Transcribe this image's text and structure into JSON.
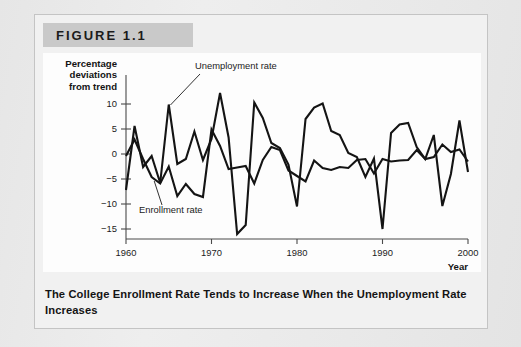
{
  "figure": {
    "banner_label": "FIGURE 1.1",
    "caption": "The College Enrollment Rate Tends to Increase When the Unemployment Rate Increases"
  },
  "chart_data": {
    "type": "line",
    "title": "",
    "xlabel": "Year",
    "ylabel": "Percentage deviations from trend",
    "ylabel_lines": [
      "Percentage",
      "deviations",
      "from trend"
    ],
    "xlim": [
      1960,
      2000
    ],
    "ylim": [
      -17,
      13
    ],
    "yticks": [
      10,
      5,
      0,
      -5,
      -10,
      -15
    ],
    "ytick_labels": [
      "10",
      "5",
      "0",
      "−5",
      "−10",
      "−15"
    ],
    "xticks": [
      1960,
      1970,
      1980,
      1990,
      2000
    ],
    "xtick_labels": [
      "1960",
      "1970",
      "1980",
      "1990",
      "2000"
    ],
    "grid": false,
    "legend_position": "inline-annotations",
    "annotations": [
      {
        "text": "Unemployment rate",
        "anchor_year": 1965.2,
        "anchor_value": 9.8
      },
      {
        "text": "Enrollment rate",
        "anchor_year": 1963.3,
        "anchor_value": -5.4
      }
    ],
    "x": [
      1960,
      1961,
      1962,
      1963,
      1964,
      1965,
      1966,
      1967,
      1968,
      1969,
      1970,
      1971,
      1972,
      1973,
      1974,
      1975,
      1976,
      1977,
      1978,
      1979,
      1980,
      1981,
      1982,
      1983,
      1984,
      1985,
      1986,
      1987,
      1988,
      1989,
      1990,
      1991,
      1992,
      1993,
      1994,
      1995,
      1996,
      1997,
      1998,
      1999,
      2000
    ],
    "series": [
      {
        "name": "Unemployment rate",
        "color": "#141414",
        "values": [
          -7.2,
          5.6,
          -2.6,
          -0.4,
          -5.8,
          9.9,
          -2.0,
          -1.0,
          4.5,
          -1.2,
          3.0,
          12.2,
          3.3,
          -16.0,
          -14.2,
          10.3,
          7.2,
          2.2,
          1.2,
          -2.1,
          -10.5,
          7.0,
          9.3,
          10.1,
          4.6,
          3.8,
          0.2,
          -0.6,
          -4.6,
          -0.9,
          -15.0,
          4.2,
          5.9,
          6.2,
          1.4,
          -1.0,
          3.8,
          -10.4,
          -4.0,
          6.7,
          -3.6
        ]
      },
      {
        "name": "Enrollment rate",
        "color": "#141414",
        "values": [
          -0.4,
          2.9,
          -1.0,
          -4.6,
          -5.9,
          -2.5,
          -8.4,
          -6.0,
          -8.0,
          -8.6,
          4.9,
          1.6,
          -3.0,
          -2.7,
          -2.4,
          -5.9,
          -1.2,
          1.4,
          0.8,
          -3.3,
          -4.4,
          -5.5,
          -1.3,
          -2.8,
          -3.2,
          -2.6,
          -2.8,
          -1.2,
          -1.0,
          -3.9,
          -1.0,
          -1.5,
          -1.3,
          -1.2,
          0.8,
          -1.0,
          -0.6,
          1.9,
          0.4,
          0.9,
          -1.5
        ]
      }
    ]
  }
}
